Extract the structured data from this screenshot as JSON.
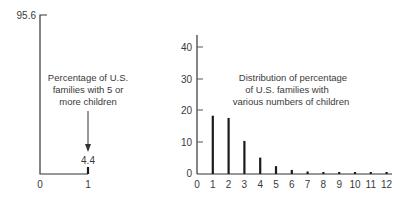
{
  "chart_data": [
    {
      "type": "bar",
      "title": "",
      "annotation": [
        "Percentage of U.S.",
        "families with 5 or",
        "more children"
      ],
      "categories": [
        "0",
        "1"
      ],
      "values": [
        95.6,
        4.4
      ],
      "value_labels": [
        "95.6",
        "4.4"
      ],
      "xlabel": "",
      "ylabel": "",
      "x_ticks": [
        "0",
        "1"
      ],
      "grid": false,
      "legend": null
    },
    {
      "type": "bar",
      "title": "",
      "annotation": [
        "Distribution of percentage",
        "of U.S. families with",
        "various numbers of children"
      ],
      "categories": [
        "1",
        "2",
        "3",
        "4",
        "5",
        "6",
        "7",
        "8",
        "9",
        "10",
        "11",
        "12"
      ],
      "values": [
        18.5,
        17.8,
        10.5,
        5.2,
        2.5,
        1.3,
        0.8,
        0.6,
        0.5,
        0.4,
        0.3,
        0.3
      ],
      "xlabel": "",
      "ylabel": "",
      "x_ticks": [
        "0",
        "1",
        "2",
        "3",
        "4",
        "5",
        "6",
        "7",
        "8",
        "9",
        "10",
        "11",
        "12"
      ],
      "y_ticks": [
        "0",
        "10",
        "20",
        "30",
        "40"
      ],
      "ylim": [
        0,
        43
      ],
      "grid": false,
      "legend": null
    }
  ],
  "left_chart": {
    "top_label": "95.6",
    "value_label": "4.4",
    "x_labels": [
      "0",
      "1"
    ],
    "annotation_lines": [
      "Percentage of U.S.",
      "families with 5 or",
      "more children"
    ]
  },
  "right_chart": {
    "y_labels": [
      "40",
      "30",
      "20",
      "10",
      "0"
    ],
    "x_labels": [
      "0",
      "1",
      "2",
      "3",
      "4",
      "5",
      "6",
      "7",
      "8",
      "9",
      "10",
      "11",
      "12"
    ],
    "annotation_lines": [
      "Distribution of percentage",
      "of U.S. families with",
      "various numbers of children"
    ]
  }
}
